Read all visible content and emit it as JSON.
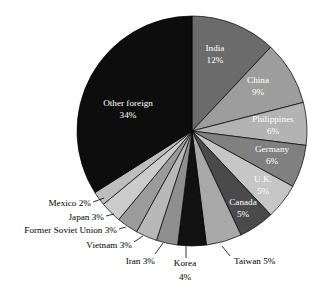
{
  "chart_data": {
    "type": "pie",
    "title": "",
    "subtitle": "",
    "xlabel": "",
    "ylabel": "",
    "legend_position": "none",
    "grid": false,
    "unit": "percent",
    "start_angle_deg": 0,
    "direction": "clockwise",
    "categories": [
      "India",
      "China",
      "Philippines",
      "Germany",
      "U.K.",
      "Canada",
      "Taiwan",
      "Korea",
      "Iran",
      "Vietnam",
      "Former Soviet Union",
      "Japan",
      "Mexico",
      "Other foreign"
    ],
    "values": [
      12,
      9,
      6,
      6,
      5,
      5,
      5,
      4,
      3,
      3,
      3,
      3,
      2,
      34
    ],
    "slices": [
      {
        "name": "India",
        "label": "India",
        "value_label": "12%",
        "value": 12,
        "color": "#6b6b6b",
        "label_placement": "inside",
        "label_fill": "on-dark",
        "label_x": 215,
        "label_y": 49,
        "value_x": 215,
        "value_y": 61
      },
      {
        "name": "China",
        "label": "China",
        "value_label": "9%",
        "value": 9,
        "color": "#9d9d9d",
        "label_placement": "inside",
        "label_fill": "on-dark",
        "label_x": 258,
        "label_y": 81,
        "value_x": 258,
        "value_y": 93
      },
      {
        "name": "Philippines",
        "label": "Philippines",
        "value_label": "6%",
        "value": 6,
        "color": "#b3b3b3",
        "label_placement": "inside",
        "label_fill": "on-dark",
        "label_x": 273,
        "label_y": 120,
        "value_x": 273,
        "value_y": 132
      },
      {
        "name": "Germany",
        "label": "Germany",
        "value_label": "6%",
        "value": 6,
        "color": "#808080",
        "label_placement": "inside",
        "label_fill": "on-dark",
        "label_x": 272,
        "label_y": 150,
        "value_x": 272,
        "value_y": 162
      },
      {
        "name": "U.K.",
        "label": "U.K.",
        "value_label": "5%",
        "value": 5,
        "color": "#c6c6c6",
        "label_placement": "inside",
        "label_fill": "on-dark",
        "label_x": 263,
        "label_y": 180,
        "value_x": 263,
        "value_y": 192
      },
      {
        "name": "Canada",
        "label": "Canada",
        "value_label": "5%",
        "value": 5,
        "color": "#4a4a4a",
        "label_placement": "inside",
        "label_fill": "on-dark",
        "label_x": 243,
        "label_y": 203,
        "value_x": 243,
        "value_y": 215
      },
      {
        "name": "Taiwan",
        "label": "Taiwan 5%",
        "value_label": "5%",
        "value": 5,
        "color": "#a8a8a8",
        "label_placement": "outside",
        "anchor": "anchor-start",
        "label_x": 234,
        "label_y": 262,
        "leader": [
          222,
          246,
          230,
          256
        ]
      },
      {
        "name": "Korea",
        "label": "Korea",
        "value_label": "4%",
        "value": 4,
        "color": "#111111",
        "label_placement": "outside",
        "anchor": "anchor-middle",
        "label_x": 185,
        "label_y": 264,
        "value_x": 185,
        "value_y": 278,
        "leader": [
          186,
          246,
          186,
          258
        ]
      },
      {
        "name": "Iran",
        "label": "Iran 3%",
        "value_label": "3%",
        "value": 3,
        "color": "#8f8f8f",
        "label_placement": "outside",
        "anchor": "anchor-end",
        "label_x": 155,
        "label_y": 262,
        "leader": [
          163,
          243,
          155,
          254
        ]
      },
      {
        "name": "Vietnam",
        "label": "Vietnam 3%",
        "value_label": "3%",
        "value": 3,
        "color": "#b8b8b8",
        "label_placement": "outside",
        "anchor": "anchor-end",
        "label_x": 132,
        "label_y": 246,
        "leader": [
          143,
          236,
          134,
          242
        ]
      },
      {
        "name": "Former Soviet Union",
        "label": "Former Soviet Union 3%",
        "value_label": "3%",
        "value": 3,
        "color": "#9b9b9b",
        "label_placement": "outside",
        "anchor": "anchor-end",
        "label_x": 117,
        "label_y": 231,
        "leader": [
          126,
          227,
          119,
          229
        ]
      },
      {
        "name": "Japan",
        "label": "Japan 3%",
        "value_label": "3%",
        "value": 3,
        "color": "#cccccc",
        "label_placement": "outside",
        "anchor": "anchor-end",
        "label_x": 104,
        "label_y": 218,
        "leader": [
          114,
          214,
          106,
          216
        ]
      },
      {
        "name": "Mexico",
        "label": "Mexico 2%",
        "value_label": "2%",
        "value": 2,
        "color": "#bdbdbd",
        "label_placement": "outside",
        "anchor": "anchor-end",
        "label_x": 91,
        "label_y": 204,
        "leader": [
          104,
          198,
          93,
          202
        ]
      },
      {
        "name": "Other foreign",
        "label": "Other foreign",
        "value_label": "34%",
        "value": 34,
        "color": "#0d0d0d",
        "label_placement": "inside",
        "label_fill": "on-dark",
        "label_x": 128,
        "label_y": 104,
        "value_x": 128,
        "value_y": 116
      }
    ],
    "geometry": {
      "cx": 192,
      "cy": 131,
      "r": 115
    }
  }
}
